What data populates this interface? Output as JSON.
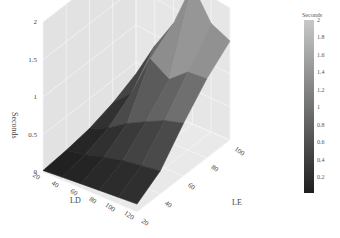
{
  "chart_data": {
    "type": "surface",
    "title": "",
    "xlabel": "LD",
    "ylabel": "LE",
    "zlabel": "Seconds",
    "x_ticks": [
      20,
      40,
      60,
      80,
      100,
      120
    ],
    "y_ticks": [
      20,
      40,
      60,
      80,
      100
    ],
    "z_ticks": [
      0,
      0.5,
      1,
      1.5,
      2
    ],
    "xlim": [
      20,
      120
    ],
    "ylim": [
      20,
      100
    ],
    "zlim": [
      0,
      2
    ],
    "x": [
      20,
      40,
      60,
      80,
      100,
      120
    ],
    "y": [
      20,
      40,
      60,
      80,
      100
    ],
    "z": [
      [
        0.02,
        0.05,
        0.1,
        0.2,
        0.35
      ],
      [
        0.04,
        0.1,
        0.22,
        0.45,
        0.85
      ],
      [
        0.06,
        0.18,
        0.4,
        1.05,
        1.3
      ],
      [
        0.08,
        0.25,
        0.55,
        0.9,
        2.0
      ],
      [
        0.1,
        0.3,
        0.7,
        1.15,
        1.6
      ],
      [
        0.12,
        0.35,
        0.8,
        1.2,
        1.5
      ]
    ],
    "colorscale": "greys",
    "colorbar": {
      "title": "Seconds",
      "ticks": [
        "2",
        "1.8",
        "1.6",
        "1.4",
        "1.2",
        "1",
        "0.8",
        "0.6",
        "0.4",
        "0.2"
      ],
      "range": [
        0.02,
        2
      ],
      "low_color": "#1e1e1e",
      "high_color": "#c8c8c8"
    },
    "grid": true,
    "legend": "right"
  }
}
